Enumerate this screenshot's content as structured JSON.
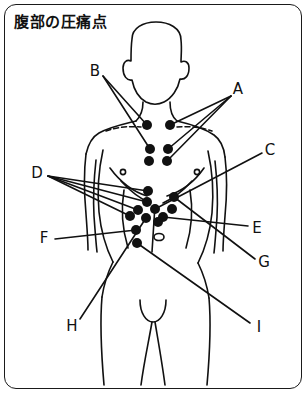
{
  "figure": {
    "title": "腹部の圧痛点",
    "frame_color": "#1a1a1a",
    "ink_color": "#111111",
    "background": "#ffffff"
  },
  "labels": [
    {
      "id": "A",
      "text": "A",
      "x": 238,
      "y": 89
    },
    {
      "id": "B",
      "text": "B",
      "x": 95,
      "y": 71
    },
    {
      "id": "C",
      "text": "C",
      "x": 270,
      "y": 150
    },
    {
      "id": "D",
      "text": "D",
      "x": 37,
      "y": 173
    },
    {
      "id": "E",
      "text": "E",
      "x": 257,
      "y": 228
    },
    {
      "id": "F",
      "text": "F",
      "x": 44,
      "y": 238
    },
    {
      "id": "G",
      "text": "G",
      "x": 264,
      "y": 262
    },
    {
      "id": "H",
      "text": "H",
      "x": 72,
      "y": 326
    },
    {
      "id": "I",
      "text": "I",
      "x": 259,
      "y": 327
    }
  ],
  "tender_points": [
    {
      "name": "left-clavicular-point",
      "x": 147,
      "y": 125
    },
    {
      "name": "right-clavicular-point",
      "x": 170,
      "y": 125
    },
    {
      "name": "upper-left-chest-point",
      "x": 150,
      "y": 149
    },
    {
      "name": "upper-right-chest-point",
      "x": 168,
      "y": 149
    },
    {
      "name": "lower-left-chest-point",
      "x": 149,
      "y": 161
    },
    {
      "name": "lower-right-chest-point",
      "x": 167,
      "y": 161
    },
    {
      "name": "epigastric-upper-point",
      "x": 148,
      "y": 191
    },
    {
      "name": "epigastric-mid-point",
      "x": 147,
      "y": 202
    },
    {
      "name": "epigastric-center-point",
      "x": 155,
      "y": 209
    },
    {
      "name": "left-hypochondrium-point",
      "x": 138,
      "y": 210
    },
    {
      "name": "right-upper-quadrant-point",
      "x": 172,
      "y": 209
    },
    {
      "name": "right-flank-point",
      "x": 174,
      "y": 197
    },
    {
      "name": "left-flank-point",
      "x": 130,
      "y": 216
    },
    {
      "name": "left-mid-abdomen-point",
      "x": 146,
      "y": 218
    },
    {
      "name": "right-mid-abdomen-point",
      "x": 163,
      "y": 217
    },
    {
      "name": "left-lower-quadrant-point",
      "x": 136,
      "y": 230
    },
    {
      "name": "suprapubic-point",
      "x": 158,
      "y": 222
    },
    {
      "name": "right-lower-quadrant-point",
      "x": 137,
      "y": 243
    }
  ],
  "anatomy": {
    "navel": {
      "name": "navel-marker",
      "x": 159,
      "y": 237
    },
    "nipples": [
      {
        "name": "left-nipple-marker",
        "x": 123,
        "y": 172
      },
      {
        "name": "right-nipple-marker",
        "x": 197,
        "y": 172
      }
    ],
    "clavicles": [
      {
        "name": "left-clavicle-dashed"
      },
      {
        "name": "right-clavicle-dashed"
      }
    ]
  }
}
